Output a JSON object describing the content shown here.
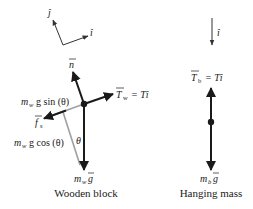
{
  "axes": {
    "j_hat": "ĵ",
    "i_hat": "î"
  },
  "wooden_block": {
    "title": "Wooden block",
    "forces": {
      "normal": "n",
      "tension": "T",
      "tension_sub": "w",
      "tension_eq": "= Tî",
      "friction": "f",
      "friction_sub": "s",
      "gravity": "m",
      "gravity_sub": "w",
      "gravity_vec": "g"
    },
    "components": {
      "parallel": "m",
      "parallel_sub": "w",
      "parallel_rest": "g sin (θ)",
      "perpendicular": "m",
      "perpendicular_sub": "w",
      "perpendicular_rest": "g cos (θ)"
    },
    "angle": "θ"
  },
  "hanging_mass": {
    "title": "Hanging mass",
    "axis": "î",
    "forces": {
      "tension": "T",
      "tension_sub": "b",
      "tension_eq": "= Tî",
      "gravity": "m",
      "gravity_sub": "b",
      "gravity_vec": "g"
    }
  },
  "colors": {
    "force": "#1a1a1a",
    "component": "#a0a0a0",
    "axis": "#333333"
  }
}
